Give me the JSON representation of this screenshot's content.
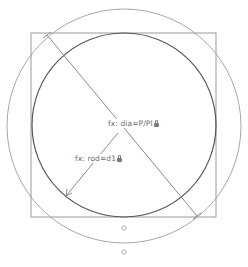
{
  "sketch": {
    "constraints": [
      {
        "id": "dia",
        "text": "fx: dia=P/PI",
        "locked": true
      },
      {
        "id": "rod",
        "text": "fx: rod=d1",
        "locked": true
      }
    ],
    "colors": {
      "square": "#9a9a9a",
      "inner_circle": "#555555",
      "outer_circle": "#a8a8a8",
      "dimension_line": "#8a8a8a",
      "text": "#6a6a6a",
      "point": "#b0b0b0"
    },
    "geometry": {
      "square": {
        "x": 31,
        "y": 33,
        "width": 185,
        "height": 184
      },
      "inner_circle": {
        "cx": 124,
        "cy": 125,
        "r": 92
      },
      "outer_circle": {
        "cx": 124,
        "cy": 126,
        "r": 117
      },
      "diameter_line": {
        "x1": 47,
        "y1": 35,
        "x2": 197,
        "y2": 216
      },
      "radius_line": {
        "x1": 124,
        "y1": 125,
        "x2": 66,
        "y2": 196
      },
      "points": [
        {
          "cx": 124,
          "cy": 228
        },
        {
          "cx": 124,
          "cy": 252
        }
      ]
    }
  }
}
